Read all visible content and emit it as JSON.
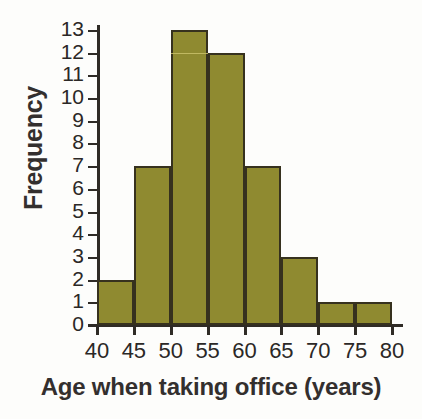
{
  "chart_data": {
    "type": "bar",
    "title": "",
    "xlabel": "Age when taking office (years)",
    "ylabel": "Frequency",
    "categories": [
      "40-45",
      "45-50",
      "50-55",
      "55-60",
      "60-65",
      "65-70",
      "70-75",
      "75-80"
    ],
    "bin_edges": [
      40,
      45,
      50,
      55,
      60,
      65,
      70,
      75,
      80
    ],
    "values": [
      2,
      7,
      13,
      12,
      7,
      3,
      1,
      1
    ],
    "xlim": [
      40,
      80
    ],
    "ylim": [
      0,
      13
    ],
    "xticks": [
      "40",
      "45",
      "50",
      "55",
      "60",
      "65",
      "70",
      "75",
      "80"
    ],
    "xtick_values": [
      40,
      45,
      50,
      55,
      60,
      65,
      70,
      75,
      80
    ],
    "yticks": [
      "13",
      "12",
      "11",
      "10",
      "9",
      "8",
      "7",
      "6",
      "5",
      "4",
      "3",
      "2",
      "1",
      "0"
    ],
    "ytick_values": [
      13,
      12,
      11,
      10,
      9,
      8,
      7,
      6,
      5,
      4,
      3,
      2,
      1,
      0
    ],
    "grid": false,
    "legend": null,
    "colors": {
      "bar_fill": "#8f8a30",
      "bar_edge": "#36311e",
      "axis": "#2f2b26",
      "text": "#2b2826",
      "title_text": "#332f2e",
      "background": "#fdfdfb"
    }
  }
}
